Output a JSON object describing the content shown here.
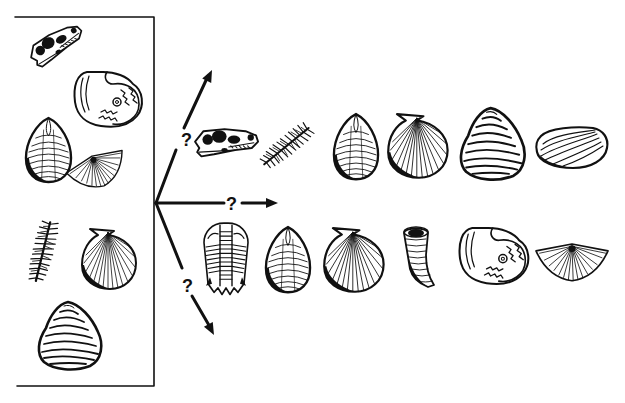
{
  "diagram": {
    "type": "fossil-evolution-branching",
    "colors": {
      "ink": "#111111",
      "background": "#ffffff"
    },
    "source_box": {
      "label": "mixed fossil assemblage",
      "fossils": [
        {
          "id": "skull",
          "kind": "reptile skull"
        },
        {
          "id": "ammonite",
          "kind": "ammonite"
        },
        {
          "id": "oval-shell",
          "kind": "oval bivalve"
        },
        {
          "id": "brachiopod-fan",
          "kind": "spiriferid brachiopod"
        },
        {
          "id": "crinoid",
          "kind": "crinoid / feather stem"
        },
        {
          "id": "scallop",
          "kind": "scallop (pectinid)"
        },
        {
          "id": "oyster",
          "kind": "oyster"
        }
      ]
    },
    "branches": [
      {
        "direction": "up",
        "label": "?"
      },
      {
        "direction": "right",
        "label": "?"
      },
      {
        "direction": "down",
        "label": "?"
      }
    ],
    "upper_row": {
      "fossils": [
        {
          "id": "skull",
          "kind": "reptile skull"
        },
        {
          "id": "crinoid",
          "kind": "crinoid / feather stem"
        },
        {
          "id": "oval-shell",
          "kind": "oval bivalve"
        },
        {
          "id": "scallop",
          "kind": "scallop (pectinid)"
        },
        {
          "id": "oyster",
          "kind": "oyster"
        },
        {
          "id": "clam",
          "kind": "clam"
        }
      ]
    },
    "lower_row": {
      "fossils": [
        {
          "id": "trilobite",
          "kind": "trilobite"
        },
        {
          "id": "oval-shell",
          "kind": "oval bivalve"
        },
        {
          "id": "scallop",
          "kind": "scallop (pectinid)"
        },
        {
          "id": "horn-coral",
          "kind": "horn coral"
        },
        {
          "id": "ammonite",
          "kind": "ammonite"
        },
        {
          "id": "brachiopod-fan",
          "kind": "spiriferid brachiopod"
        }
      ]
    }
  }
}
